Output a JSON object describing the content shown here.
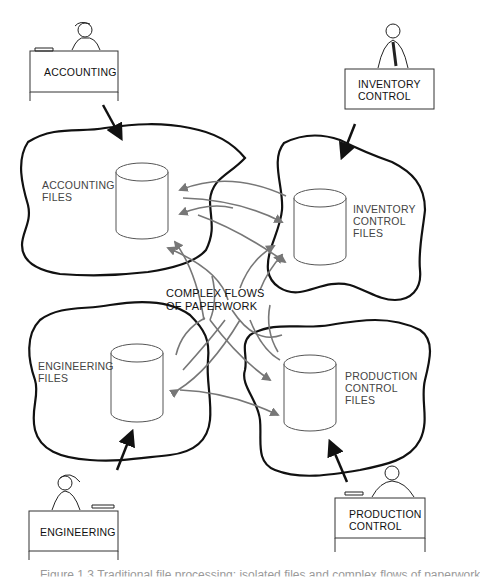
{
  "departments": [
    {
      "id": "accounting",
      "label": "ACCOUNTING"
    },
    {
      "id": "inventory",
      "label": "INVENTORY\nCONTROL"
    },
    {
      "id": "engineering",
      "label": "ENGINEERING"
    },
    {
      "id": "production",
      "label": "PRODUCTION\nCONTROL"
    }
  ],
  "file_stores": [
    {
      "id": "accounting-files",
      "label": "ACCOUNTING\nFILES"
    },
    {
      "id": "inventory-files",
      "label": "INVENTORY\nCONTROL\nFILES"
    },
    {
      "id": "engineering-files",
      "label": "ENGINEERING\nFILES"
    },
    {
      "id": "production-files",
      "label": "PRODUCTION\nCONTROL\nFILES"
    }
  ],
  "center_label": "COMPLEX FLOWS\nOF PAPERWORK",
  "caption": "Figure 1.3   Traditional file processing: isolated files and complex flows of paperwork",
  "colors": {
    "outline": "#111111",
    "flow_arrow": "#777777",
    "cylinder": "#555555"
  }
}
